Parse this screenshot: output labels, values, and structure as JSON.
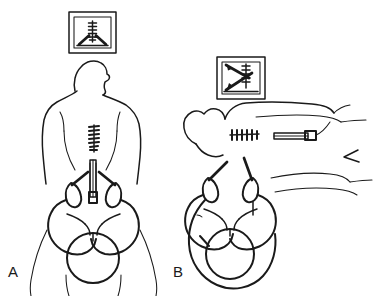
{
  "figure": {
    "caption_absent": true,
    "background_color": "#ffffff",
    "ink_color": "#1a1a1a",
    "style": "black-and-white line drawing, medical illustration",
    "panel_count": 2
  },
  "panels": [
    {
      "id": "A",
      "label": "A",
      "view_name": "posterior-view-seated-patient",
      "monitor": {
        "name": "imaging-monitor-panel-a",
        "screen_content": "transverse-spine-image-with-two-converging-needle-paths",
        "spine_marks": 6,
        "needle_paths": 2,
        "needle_path_shape": "converging-V"
      },
      "patient": {
        "orientation": "posterior",
        "spinous_process_marks": 7,
        "needle": {
          "name": "spinal-needle-midline",
          "orientation": "vertical-midline",
          "hub_visible": true
        },
        "palpating_hands": 2,
        "landmark_lines": 2
      }
    },
    {
      "id": "B",
      "label": "B",
      "view_name": "lateral-view-decubitus-patient",
      "monitor": {
        "name": "imaging-monitor-panel-b",
        "screen_content": "parasagittal-spine-image-with-oblique-needle-path",
        "spine_marks": 5,
        "needle_paths": 1,
        "needle_path_shape": "oblique-diagonal"
      },
      "patient": {
        "orientation": "lateral-decubitus",
        "spinous_process_marks": 6,
        "needle": {
          "name": "spinal-needle-lateral",
          "orientation": "horizontal",
          "hub_visible": true
        },
        "palpating_hands": 2,
        "leg_marker": "chevron"
      }
    }
  ]
}
